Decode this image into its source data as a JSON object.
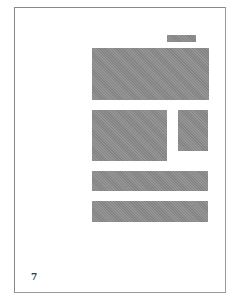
{
  "document": {
    "page_number": "7",
    "placeholder_color": "#8c8c8c",
    "border_color": "#8a8a8a",
    "blocks": [
      {
        "name": "header-tag-placeholder",
        "kind": "text-block"
      },
      {
        "name": "top-image-placeholder",
        "kind": "image"
      },
      {
        "name": "middle-left-image-placeholder",
        "kind": "image"
      },
      {
        "name": "middle-right-image-placeholder",
        "kind": "image"
      },
      {
        "name": "bar-placeholder-1",
        "kind": "text-block"
      },
      {
        "name": "bar-placeholder-2",
        "kind": "text-block"
      }
    ]
  }
}
